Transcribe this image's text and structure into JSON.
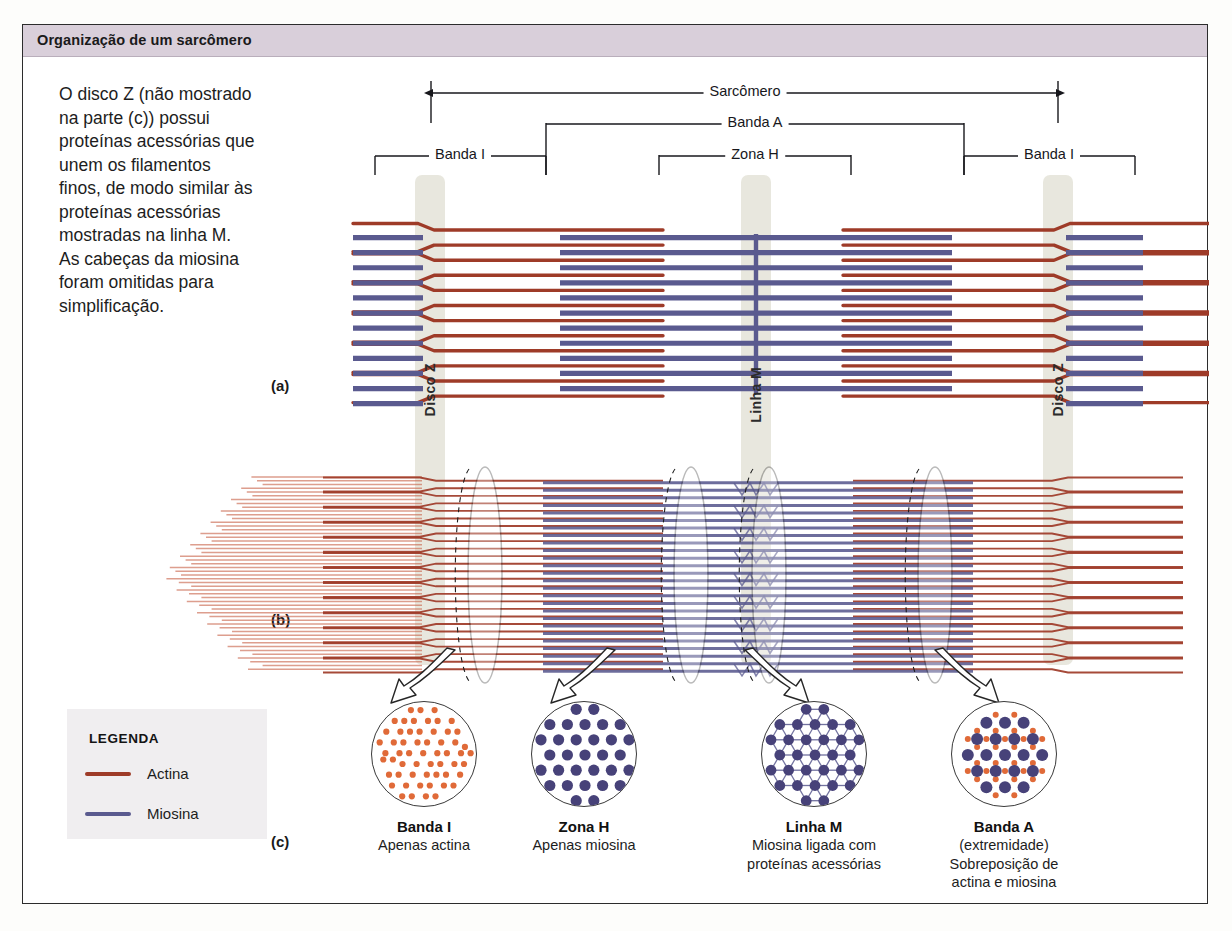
{
  "figure": {
    "title": "Organização de um sarcômero",
    "caption": "O disco Z (não mostrado na parte (c)) possui proteínas acessórias que unem os filamentos finos, de modo similar às proteínas acessórias mostradas na linha M. As cabeças da miosina foram omitidas para simplificação.",
    "panel_labels": {
      "a": "(a)",
      "b": "(b)",
      "c": "(c)"
    },
    "title_bar_color": "#d9cfda"
  },
  "brackets": {
    "sarcomere": "Sarcômero",
    "band_a": "Banda A",
    "zone_h": "Zona H",
    "band_i_left": "Banda I",
    "band_i_right": "Banda I"
  },
  "structures": {
    "z_disc_left": "Disco Z",
    "m_line": "Linha M",
    "z_disc_right": "Disco Z",
    "band_fill_color": "#e6e5db"
  },
  "legend": {
    "title": "LEGENDA",
    "items": [
      {
        "label": "Actina",
        "color": "#9e3b28"
      },
      {
        "label": "Miosina",
        "color": "#5a5a8f"
      }
    ]
  },
  "cross_sections": [
    {
      "name": "Banda I",
      "description": "Apenas actina",
      "description_line2": "",
      "description_line3": "",
      "content": "actin-only"
    },
    {
      "name": "Zona H",
      "description": "Apenas miosina",
      "description_line2": "",
      "description_line3": "",
      "content": "myosin-only"
    },
    {
      "name": "Linha M",
      "description": "Miosina ligada com",
      "description_line2": "proteínas acessórias",
      "description_line3": "",
      "content": "myosin-linked"
    },
    {
      "name": "Banda A",
      "description": "(extremidade)",
      "description_line2": "Sobreposição de",
      "description_line3": "actina e miosina",
      "content": "actin-myosin-overlap"
    }
  ],
  "colors": {
    "actin": "#9e3b28",
    "actin_light": "#c9644a",
    "actin_dot": "#e06a38",
    "myosin": "#5a5a8f",
    "myosin_dot": "#474279",
    "frame": "#2c2c2c",
    "band": "#e6e5db",
    "page": "#ffffff"
  }
}
